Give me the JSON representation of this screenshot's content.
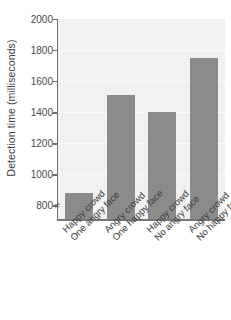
{
  "chart_data": {
    "type": "bar",
    "title": "",
    "xlabel": "",
    "ylabel": "Detection time (milliseconds)",
    "categories": [
      "Happy crowd One angry face",
      "Angry crowd One happy face",
      "Happy crowd No angry face",
      "Angry crowd No happy face"
    ],
    "category_lines": [
      {
        "line1": "Happy crowd",
        "line2": "One angry face"
      },
      {
        "line1": "Angry crowd",
        "line2": "One happy face"
      },
      {
        "line1": "Happy crowd",
        "line2": "No angry face"
      },
      {
        "line1": "Angry crowd",
        "line2": "No happy face"
      }
    ],
    "values": [
      880,
      1510,
      1400,
      1750
    ],
    "ylim": [
      700,
      2000
    ],
    "yticks": [
      800,
      1000,
      1200,
      1400,
      1600,
      1800,
      2000
    ],
    "ytick_labels": [
      "800",
      "1000",
      "1200",
      "1400",
      "1600",
      "1800",
      "2000"
    ],
    "grid": true,
    "grid_axis": "y",
    "legend": false,
    "axis_break": true,
    "axis_break_symbol": "≠",
    "bar_color": "#8b8b8b",
    "plot_background": "#f1f1f1",
    "axis_color": "#6e6e6e",
    "gridline_color": "#fbfbfb"
  }
}
